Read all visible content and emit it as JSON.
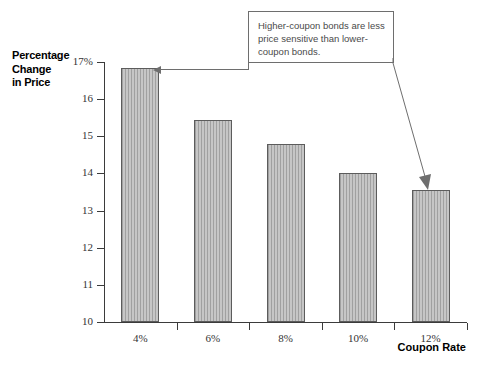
{
  "chart_data": {
    "type": "bar",
    "title": "",
    "xlabel": "Coupon Rate",
    "ylabel": "Percentage Change in Price",
    "categories": [
      "4%",
      "6%",
      "8%",
      "10%",
      "12%"
    ],
    "values": [
      16.85,
      15.45,
      14.8,
      14.0,
      13.55
    ],
    "ylim": [
      10,
      17
    ],
    "ytick_labels": [
      "17%",
      "16",
      "15",
      "14",
      "13",
      "12",
      "11",
      "10"
    ],
    "ytick_values": [
      17,
      16,
      15,
      14,
      13,
      12,
      11,
      10
    ],
    "grid": false,
    "legend": null,
    "annotations": [
      {
        "text": "Higher-coupon bonds are less price sensitive than lower-coupon bonds.",
        "points_to": [
          "4%",
          "12%"
        ]
      }
    ],
    "bar_fill": "#b9b9b9",
    "bar_stroke": "#5c5c5c",
    "axis_color": "#3b3b3b"
  },
  "axis": {
    "y_title_lines": [
      "Percentage",
      "Change",
      "in Price"
    ],
    "x_title": "Coupon Rate"
  },
  "callout": {
    "text": "Higher-coupon bonds are less price sensitive than lower-coupon bonds."
  }
}
